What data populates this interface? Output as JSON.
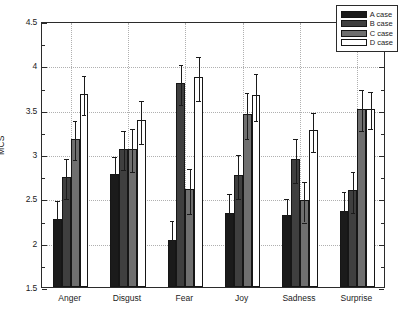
{
  "chart_data": {
    "type": "bar",
    "title": "",
    "xlabel": "",
    "ylabel": "MCS",
    "ylim": [
      1.5,
      4.5
    ],
    "ytick_labels": [
      "1.5",
      "2",
      "2.5",
      "3",
      "3.5",
      "4",
      "4.5"
    ],
    "ytick_values": [
      1.5,
      2,
      2.5,
      3,
      3.5,
      4,
      4.5
    ],
    "grid": true,
    "legend_position": "upper right",
    "categories": [
      "Anger",
      "Disgust",
      "Fear",
      "Joy",
      "Sadness",
      "Surprise"
    ],
    "series": [
      {
        "name": "A case",
        "color": "#1b1b1b",
        "values": [
          2.27,
          2.78,
          2.03,
          2.33,
          2.31,
          2.36
        ],
        "errors": [
          0.22,
          0.21,
          0.24,
          0.24,
          0.21,
          0.23
        ]
      },
      {
        "name": "B case",
        "color": "#3f3f3f",
        "values": [
          2.74,
          3.06,
          3.8,
          2.76,
          2.94,
          2.59
        ],
        "errors": [
          0.23,
          0.22,
          0.23,
          0.25,
          0.25,
          0.23
        ]
      },
      {
        "name": "C case",
        "color": "#6f6f6f",
        "values": [
          3.17,
          3.06,
          2.6,
          3.45,
          2.48,
          3.51
        ],
        "errors": [
          0.22,
          0.24,
          0.25,
          0.26,
          0.23,
          0.23
        ]
      },
      {
        "name": "D case",
        "color": "#ffffff",
        "values": [
          3.68,
          3.38,
          3.87,
          3.66,
          3.27,
          3.51
        ],
        "errors": [
          0.22,
          0.24,
          0.25,
          0.26,
          0.22,
          0.21
        ]
      }
    ]
  },
  "legend": {
    "items": [
      {
        "label": "A case"
      },
      {
        "label": "B case"
      },
      {
        "label": "C case"
      },
      {
        "label": "D case"
      }
    ]
  },
  "axes": {
    "y_label": "MCS"
  }
}
